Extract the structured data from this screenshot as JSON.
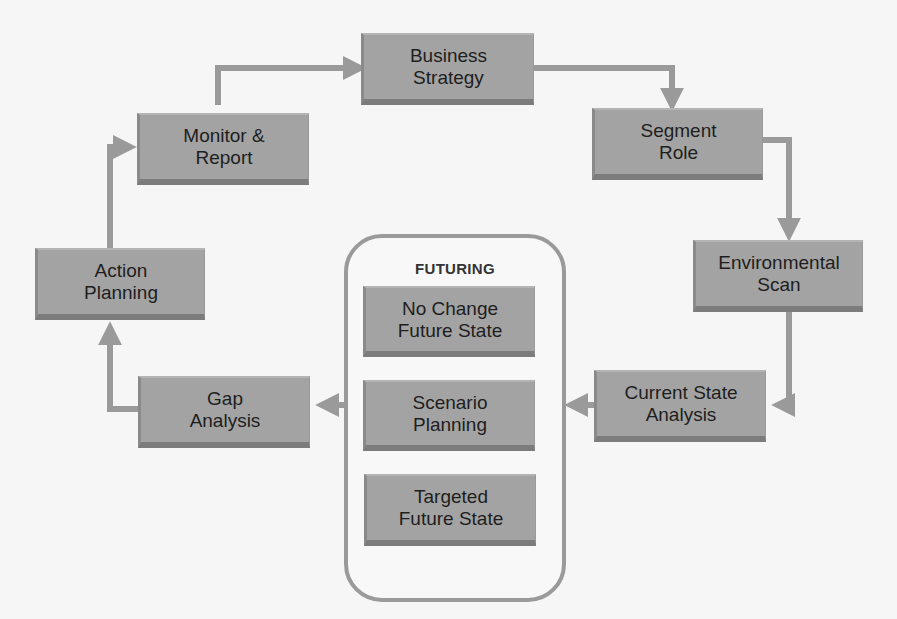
{
  "diagram": {
    "colors": {
      "box_fill": "#a3a3a3",
      "box_shadow": "#7c7c7c",
      "connector": "#9a9a9a",
      "text": "#1e1e1e",
      "background": "#f6f6f6"
    },
    "nodes": {
      "business_strategy": {
        "line1": "Business",
        "line2": "Strategy"
      },
      "segment_role": {
        "line1": "Segment",
        "line2": "Role"
      },
      "environmental_scan": {
        "line1": "Environmental",
        "line2": "Scan"
      },
      "current_state_analysis": {
        "line1": "Current State",
        "line2": "Analysis"
      },
      "gap_analysis": {
        "line1": "Gap",
        "line2": "Analysis"
      },
      "action_planning": {
        "line1": "Action",
        "line2": "Planning"
      },
      "monitor_report": {
        "line1": "Monitor &",
        "line2": "Report"
      }
    },
    "futuring": {
      "title": "FUTURING",
      "items": [
        {
          "line1": "No Change",
          "line2": "Future State"
        },
        {
          "line1": "Scenario",
          "line2": "Planning"
        },
        {
          "line1": "Targeted",
          "line2": "Future State"
        }
      ]
    },
    "flow": [
      "Business Strategy",
      "Segment Role",
      "Environmental Scan",
      "Current State Analysis",
      "FUTURING",
      "Gap Analysis",
      "Action Planning",
      "Monitor & Report",
      "Business Strategy"
    ]
  }
}
